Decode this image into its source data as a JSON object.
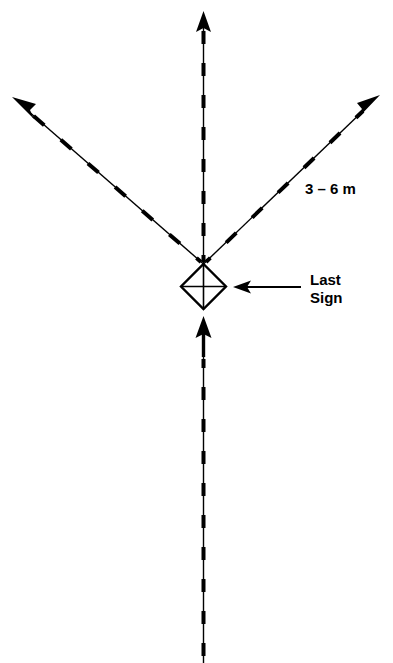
{
  "figure": {
    "type": "road-sign-placement-diagram",
    "background_color": "#ffffff",
    "stroke_color": "#000000",
    "width": 393,
    "height": 663
  },
  "labels": {
    "spacing": {
      "text": "3 – 6 m",
      "x": 305,
      "y": 194
    },
    "last_sign_line1": {
      "text": "Last",
      "x": 310,
      "y": 285
    },
    "last_sign_line2": {
      "text": "Sign",
      "x": 310,
      "y": 303
    }
  },
  "elements": {
    "sign_symbol": {
      "name": "diamond-sign-symbol",
      "center_x": 203.5,
      "center_y": 286.5,
      "half_size": 22.5,
      "has_internal_cross": true
    },
    "roads": [
      {
        "name": "center-road-up",
        "direction": "up",
        "from_x": 203.5,
        "from_y": 264,
        "to_x": 203.5,
        "to_y": 12,
        "arrow": true,
        "dashed": true
      },
      {
        "name": "diagonal-road-upper-left",
        "direction": "up-left",
        "from_x": 203.5,
        "from_y": 264,
        "to_x": 12,
        "to_y": 97,
        "arrow": true,
        "dashed": true
      },
      {
        "name": "diagonal-road-upper-right",
        "direction": "up-right",
        "from_x": 203.5,
        "from_y": 264,
        "to_x": 380,
        "to_y": 95,
        "arrow": true,
        "dashed": true
      },
      {
        "name": "center-road-approach-arrow",
        "direction": "up",
        "from_x": 203.5,
        "from_y": 357,
        "to_x": 203.5,
        "to_y": 317,
        "arrow": true,
        "dashed": false
      },
      {
        "name": "center-road-down",
        "direction": "down",
        "from_x": 203.5,
        "from_y": 357,
        "to_x": 203.5,
        "to_y": 663,
        "arrow": false,
        "dashed": true
      }
    ],
    "leader": {
      "name": "last-sign-leader-arrow",
      "from_x": 301,
      "from_y": 287,
      "to_x": 234,
      "to_y": 287,
      "arrow": true
    }
  }
}
